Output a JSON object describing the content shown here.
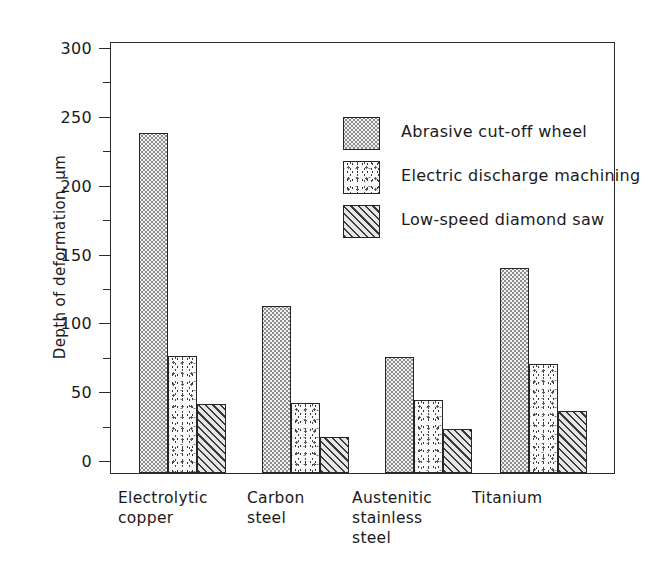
{
  "chart_data": {
    "type": "bar",
    "title": "",
    "xlabel": "",
    "ylabel": "Depth of deformation, µm",
    "ylim": [
      0,
      300
    ],
    "ytick_labels": [
      "0",
      "50",
      "100",
      "150",
      "200",
      "250",
      "300"
    ],
    "ytick_values": [
      0,
      50,
      100,
      150,
      200,
      250,
      300
    ],
    "minor_tick_values": [
      25,
      75,
      125,
      175,
      225,
      275
    ],
    "grid": false,
    "legend_position": "upper-center",
    "categories": [
      "Electrolytic\ncopper",
      "Carbon\nsteel",
      "Austenitic\nstainless\nsteel",
      "Titanium"
    ],
    "series": [
      {
        "name": "Abrasive cut-off wheel",
        "pattern": "dots",
        "values": [
          247,
          121,
          84,
          149
        ]
      },
      {
        "name": "Electric discharge machining",
        "pattern": "speckle",
        "values": [
          85,
          51,
          53,
          79
        ]
      },
      {
        "name": "Low-speed diamond saw",
        "pattern": "hatch",
        "values": [
          50,
          26,
          32,
          45
        ]
      }
    ]
  },
  "colors": {
    "axis": "#2b2b2b",
    "text": "#1a1a1a",
    "background": "#ffffff",
    "bar_outline": "#262626"
  }
}
